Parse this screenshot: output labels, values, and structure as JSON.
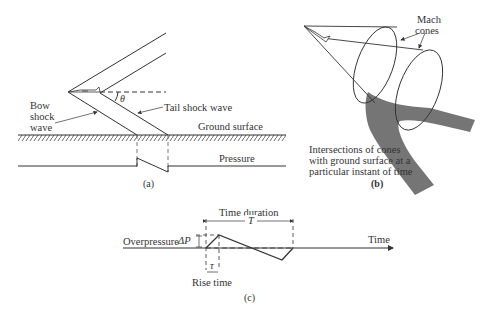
{
  "panel_a": {
    "caption": "(a)",
    "labels": {
      "bow_line1": "Bow",
      "bow_line2": "shock",
      "bow_line3": "wave",
      "tail": "Tail shock wave",
      "ground": "Ground surface",
      "pressure": "Pressure",
      "angle": "θ"
    }
  },
  "panel_b": {
    "caption": "(b)",
    "labels": {
      "mach_line1": "Mach",
      "mach_line2": "cones",
      "intersect_line1": "Intersections of cones",
      "intersect_line2": "with ground surface at a",
      "intersect_line3": "particular instant of time"
    },
    "colors": {
      "ground_band": "#6e6e6e"
    }
  },
  "panel_c": {
    "caption": "(c)",
    "labels": {
      "time_duration": "Time duration",
      "T": "T",
      "overpressure": "Overpressure",
      "delta_p": "ΔP",
      "time": "Time",
      "tau": "τ",
      "rise_time": "Rise time"
    }
  }
}
